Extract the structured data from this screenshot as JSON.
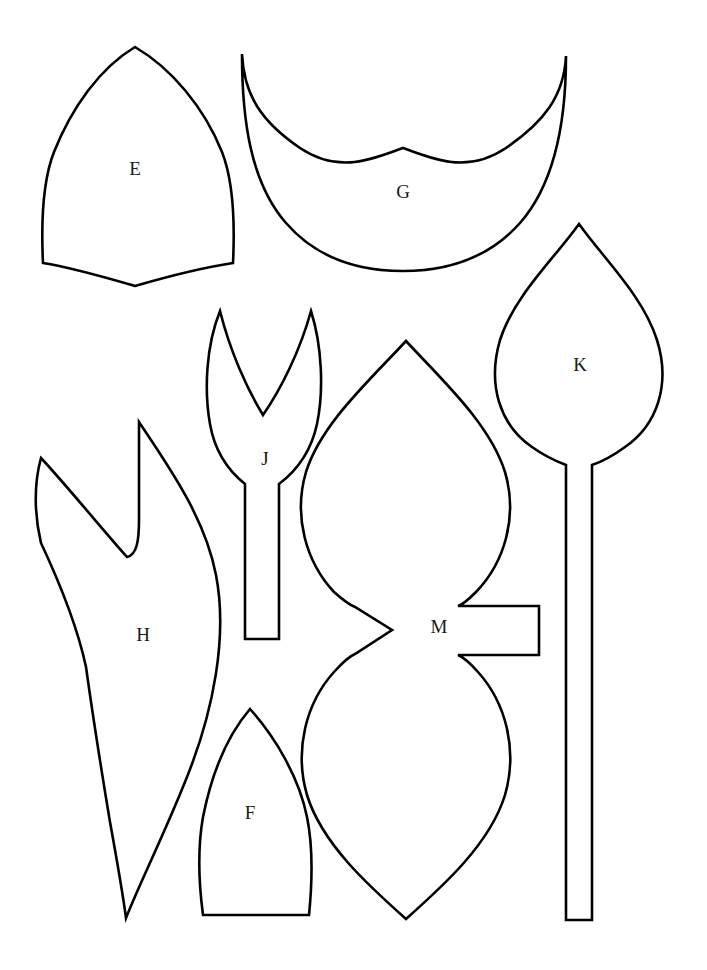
{
  "page": {
    "width": 707,
    "height": 970,
    "background_color": "#ffffff",
    "stroke_color": "#000000",
    "fill_color": "#ffffff",
    "stroke_width": 2.6,
    "label_color": "#1a1a1a",
    "label_font_size": 19
  },
  "pieces": [
    {
      "id": "E",
      "label": "E",
      "description": "pointed-arch shield petal with concave bottom edge",
      "label_x": 135,
      "label_y": 171,
      "path": "M 135 47 C 171 68 204 107 222 152 C 233 180 235 222 233 263 C 200 268 166 277 135 286 C 104 277 74 268 43 263 C 41 222 43 180 54 152 C 72 107 100 68 135 47 Z"
    },
    {
      "id": "G",
      "label": "G",
      "description": "double-lobed butterfly leaf with central V notch at top",
      "label_x": 403,
      "label_y": 194,
      "path": "M 242 54 C 244 96 262 122 300 148 C 340 175 374 158 403 148 C 432 158 466 175 506 148 C 544 122 564 96 566 56 C 566 120 556 182 520 223 C 487 260 443 271 403 271 C 362 271 318 260 286 223 C 250 182 242 118 242 54 Z"
    },
    {
      "id": "K",
      "label": "K",
      "description": "pointed leaf on a long straight stem",
      "label_x": 580,
      "label_y": 367,
      "path": "M 579 224 C 604 259 643 296 657 340 C 671 385 657 425 625 447 C 610 458 598 463 592 465 L 592 920 L 566 920 L 566 465 C 558 462 546 457 532 447 C 500 425 487 385 500 340 C 514 296 554 259 579 224 Z"
    },
    {
      "id": "J",
      "label": "J",
      "description": "forked tuning-fork petal with two prongs and a narrow stem",
      "label_x": 265,
      "label_y": 461,
      "path": "M 220 311 C 206 346 204 390 210 424 C 215 453 230 472 245 484 L 245 639 L 279 639 L 279 484 C 295 472 311 452 317 424 C 324 390 322 346 311 311 C 300 351 281 389 263 415 C 247 389 230 351 220 311 Z"
    },
    {
      "id": "H",
      "label": "H",
      "description": "flame-shaped leaf with deep side notch, long tapering lower point",
      "label_x": 143,
      "label_y": 637,
      "path": "M 139 422 C 167 464 205 517 216 575 C 228 637 213 712 187 777 C 164 835 141 880 126 918 C 122 888 116 855 110 822 C 101 768 92 710 86 667 C 76 620 56 575 41 543 C 34 514 34 483 41 458 C 68 487 101 528 127 557 C 137 555 139 540 139 520 Z"
    },
    {
      "id": "M",
      "label": "M",
      "description": "double pointed leaf (bowtie) with rectangular tab on right waist",
      "label_x": 439,
      "label_y": 629,
      "path": "M 406 341 C 443 381 490 424 505 472 C 518 516 505 562 476 592 C 468 600 462 605 458 606 L 539 606 L 539 655 L 458 655 C 463 657 470 663 478 672 C 506 703 518 750 505 795 C 490 844 443 886 406 919 C 369 886 322 844 307 795 C 294 750 306 703 334 672 C 343 662 350 656 355 654 L 392 630 L 355 607 C 350 605 343 600 334 592 C 306 562 293 516 306 472 C 321 424 369 381 406 341 Z"
    },
    {
      "id": "F",
      "label": "F",
      "description": "gothic arch petal with flat bottom edge",
      "label_x": 250,
      "label_y": 815,
      "path": "M 250 709 C 275 737 299 777 307 817 C 314 851 312 885 309 915 L 203 915 C 199 885 197 851 203 817 C 211 777 226 737 250 709 Z"
    }
  ]
}
